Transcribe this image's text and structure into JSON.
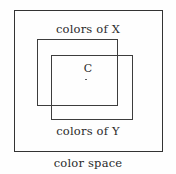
{
  "diagram": {
    "type": "nested-overlapping-rectangles",
    "background_color": "#fefefe",
    "stroke_color": "#3a3a3a",
    "text_color": "#2a2a2a",
    "regions": [
      {
        "id": "color-space",
        "label": "color space",
        "role": "outer-bounding-region"
      },
      {
        "id": "colors-of-x",
        "label": "colors of X",
        "role": "gamut-x"
      },
      {
        "id": "colors-of-y",
        "label": "colors of Y",
        "role": "gamut-y"
      }
    ],
    "points": [
      {
        "id": "c",
        "label": "C",
        "role": "color-in-intersection",
        "marker": "dot"
      }
    ]
  }
}
